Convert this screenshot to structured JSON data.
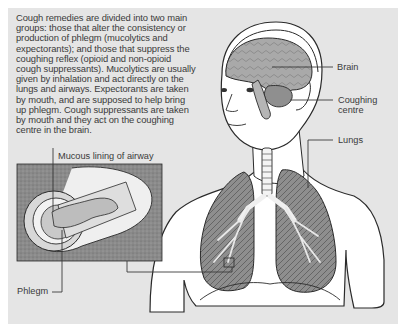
{
  "caption": "Cough remedies are divided into two main groups: those that alter the consistency or production of phlegm (mucolytics and expectorants); and those that suppress the coughing reflex (opioid and non-opioid cough suppressants). Mucolytics are usually given by inhalation and act directly on the lungs and airways. Expectorants are taken by mouth, and are supposed to help bring up phlegm. Cough suppressants are taken by mouth and they act on the coughing centre in the brain.",
  "labels": {
    "brain": "Brain",
    "coughing_centre_line1": "Coughing",
    "coughing_centre_line2": "centre",
    "lungs": "Lungs",
    "mucous_lining": "Mucous lining of airway",
    "phlegm": "Phlegm"
  },
  "colors": {
    "panel_bg": "#e5e5e5",
    "brain": "#a8a8a8",
    "lung": "#8c8c8c",
    "inset_bg": "#8a8a8a",
    "line": "#3a3a3a"
  }
}
